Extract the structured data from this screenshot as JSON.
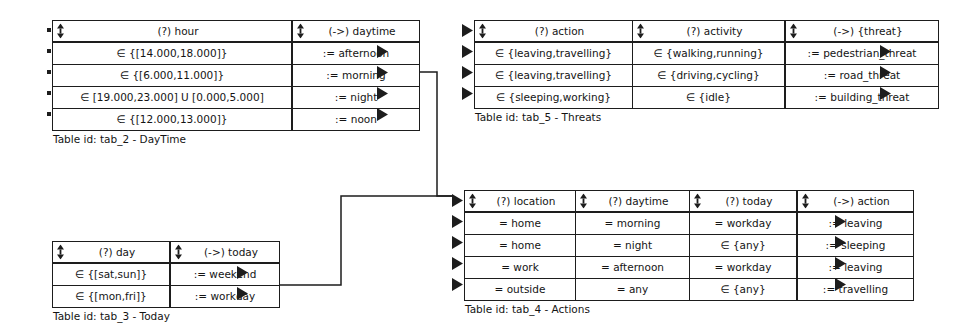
{
  "diagram": {
    "line_color": "#1d1d1d",
    "background": "#ffffff",
    "symbols": {
      "sort_icon": "sort-updown-icon",
      "input_arrow": "input-arrow-icon",
      "output_arrow": "output-arrow-icon",
      "port_stub": "port-stub-icon"
    }
  },
  "tables": [
    {
      "id": "tab_2",
      "name": "DayTime",
      "caption": "Table id: tab_2 - DayTime",
      "columns": [
        {
          "label": "(?) hour",
          "kind": "condition"
        },
        {
          "label": "(->) daytime",
          "kind": "conclusion"
        }
      ],
      "rows": [
        {
          "cells": [
            "∈ {[14.000,18.000]}",
            ":= afternoon"
          ]
        },
        {
          "cells": [
            "∈ {[6.000,11.000]}",
            ":= morning"
          ]
        },
        {
          "cells": [
            "∈ [19.000,23.000] U [0.000,5.000]",
            ":= night"
          ]
        },
        {
          "cells": [
            "∈ {[12.000,13.000]}",
            ":= noon"
          ]
        }
      ]
    },
    {
      "id": "tab_5",
      "name": "Threats",
      "caption": "Table id: tab_5 - Threats",
      "columns": [
        {
          "label": "(?) action",
          "kind": "condition"
        },
        {
          "label": "(?) activity",
          "kind": "condition"
        },
        {
          "label": "(->) {threat}",
          "kind": "conclusion"
        }
      ],
      "rows": [
        {
          "cells": [
            "∈ {leaving,travelling}",
            "∈ {walking,running}",
            ":= pedestrian_threat"
          ]
        },
        {
          "cells": [
            "∈ {leaving,travelling}",
            "∈ {driving,cycling}",
            ":= road_threat"
          ]
        },
        {
          "cells": [
            "∈ {sleeping,working}",
            "∈ {idle}",
            ":= building_threat"
          ]
        }
      ]
    },
    {
      "id": "tab_3",
      "name": "Today",
      "caption": "Table id: tab_3 - Today",
      "columns": [
        {
          "label": "(?) day",
          "kind": "condition"
        },
        {
          "label": "(->) today",
          "kind": "conclusion"
        }
      ],
      "rows": [
        {
          "cells": [
            "∈ {[sat,sun]}",
            ":= weekend"
          ]
        },
        {
          "cells": [
            "∈ {[mon,fri]}",
            ":= workday"
          ]
        }
      ]
    },
    {
      "id": "tab_4",
      "name": "Actions",
      "caption": "Table id: tab_4 - Actions",
      "columns": [
        {
          "label": "(?) location",
          "kind": "condition"
        },
        {
          "label": "(?) daytime",
          "kind": "condition"
        },
        {
          "label": "(?) today",
          "kind": "condition"
        },
        {
          "label": "(->) action",
          "kind": "conclusion"
        }
      ],
      "rows": [
        {
          "cells": [
            "= home",
            "= morning",
            "= workday",
            ":= leaving"
          ]
        },
        {
          "cells": [
            "= home",
            "= night",
            "∈ {any}",
            ":= sleeping"
          ]
        },
        {
          "cells": [
            "= work",
            "= afternoon",
            "= workday",
            ":= leaving"
          ]
        },
        {
          "cells": [
            "= outside",
            "= any",
            "∈ {any}",
            ":= travelling"
          ]
        }
      ]
    }
  ],
  "connections": [
    {
      "from": "tab_2.row2.daytime",
      "to": "tab_4.header"
    },
    {
      "from": "tab_3.row2.today",
      "to": "tab_4.header"
    }
  ]
}
